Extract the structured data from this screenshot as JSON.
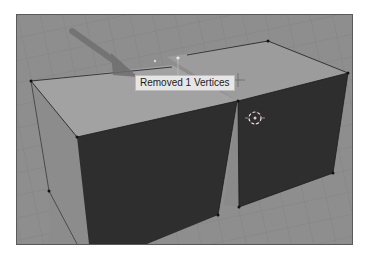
{
  "viewport": {
    "label": "3D viewport",
    "objects": [
      {
        "name": "left-cube",
        "type": "box"
      },
      {
        "name": "right-cube",
        "type": "box"
      }
    ],
    "colors": {
      "floor": "#8e8e8e",
      "grid": "#7c7c7c",
      "top_face": "#9c9c9c",
      "front_face": "#2e2e2e",
      "side_face": "#8a8a8a",
      "edge": "#1c1c1c",
      "arrow": "#6e6e6e"
    }
  },
  "status_tooltip": {
    "text": "Removed 1 Vertices"
  },
  "cursor": {
    "icon": "3d-cursor-icon"
  }
}
